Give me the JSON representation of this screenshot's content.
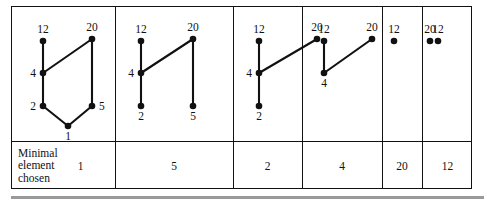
{
  "figure": {
    "colors": {
      "ink": "#111111",
      "rule": "#9a9a9a",
      "background": "#ffffff"
    },
    "caption_row": {
      "label": "Minimal\nelement\nchosen",
      "values": [
        "1",
        "5",
        "2",
        "4",
        "20",
        "12"
      ]
    },
    "panels": [
      {
        "id": "panel-1",
        "chosen": "1",
        "nodes": [
          {
            "id": "n12",
            "label": "12",
            "x": 31,
            "y": 34,
            "label_pos": "above"
          },
          {
            "id": "n20",
            "label": "20",
            "x": 80,
            "y": 32,
            "label_pos": "above"
          },
          {
            "id": "n4",
            "label": "4",
            "x": 31,
            "y": 66,
            "label_pos": "left"
          },
          {
            "id": "n2",
            "label": "2",
            "x": 31,
            "y": 99,
            "label_pos": "left"
          },
          {
            "id": "n5",
            "label": "5",
            "x": 80,
            "y": 99,
            "label_pos": "right"
          },
          {
            "id": "n1",
            "label": "1",
            "x": 56,
            "y": 119,
            "label_pos": "below"
          }
        ],
        "edges": [
          [
            "n12",
            "n4"
          ],
          [
            "n4",
            "n20"
          ],
          [
            "n4",
            "n2"
          ],
          [
            "n20",
            "n5"
          ],
          [
            "n2",
            "n1"
          ],
          [
            "n5",
            "n1"
          ]
        ]
      },
      {
        "id": "panel-2",
        "chosen": "5",
        "nodes": [
          {
            "id": "n12",
            "label": "12",
            "x": 26,
            "y": 34,
            "label_pos": "above"
          },
          {
            "id": "n20",
            "label": "20",
            "x": 78,
            "y": 32,
            "label_pos": "above"
          },
          {
            "id": "n4",
            "label": "4",
            "x": 26,
            "y": 66,
            "label_pos": "left"
          },
          {
            "id": "n2",
            "label": "2",
            "x": 26,
            "y": 99,
            "label_pos": "below"
          },
          {
            "id": "n5",
            "label": "5",
            "x": 78,
            "y": 99,
            "label_pos": "below"
          }
        ],
        "edges": [
          [
            "n12",
            "n4"
          ],
          [
            "n4",
            "n20"
          ],
          [
            "n4",
            "n2"
          ],
          [
            "n20",
            "n5"
          ]
        ]
      },
      {
        "id": "panel-3",
        "chosen": "2",
        "nodes": [
          {
            "id": "n12",
            "label": "12",
            "x": 26,
            "y": 34,
            "label_pos": "above"
          },
          {
            "id": "n20",
            "label": "20",
            "x": 84,
            "y": 32,
            "label_pos": "above"
          },
          {
            "id": "n4",
            "label": "4",
            "x": 26,
            "y": 66,
            "label_pos": "left"
          },
          {
            "id": "n2",
            "label": "2",
            "x": 26,
            "y": 99,
            "label_pos": "below"
          }
        ],
        "edges": [
          [
            "n12",
            "n4"
          ],
          [
            "n4",
            "n20"
          ],
          [
            "n4",
            "n2"
          ]
        ]
      },
      {
        "id": "panel-4",
        "chosen": "4",
        "nodes": [
          {
            "id": "n12",
            "label": "12",
            "x": 22,
            "y": 34,
            "label_pos": "above"
          },
          {
            "id": "n20",
            "label": "20",
            "x": 70,
            "y": 32,
            "label_pos": "above"
          },
          {
            "id": "n4",
            "label": "4",
            "x": 22,
            "y": 66,
            "label_pos": "below"
          }
        ],
        "edges": [
          [
            "n12",
            "n4"
          ],
          [
            "n4",
            "n20"
          ]
        ]
      },
      {
        "id": "panel-5",
        "chosen": "20",
        "nodes": [
          {
            "id": "n12",
            "label": "12",
            "x": 12,
            "y": 34,
            "label_pos": "above"
          },
          {
            "id": "n20",
            "label": "20",
            "x": 48,
            "y": 34,
            "label_pos": "above"
          }
        ],
        "edges": []
      },
      {
        "id": "panel-6",
        "chosen": "12",
        "nodes": [
          {
            "id": "n12",
            "label": "12",
            "x": 16,
            "y": 34,
            "label_pos": "above"
          }
        ],
        "edges": []
      }
    ],
    "column_edges": [
      11,
      114,
      232,
      301,
      381,
      421,
      472
    ]
  }
}
